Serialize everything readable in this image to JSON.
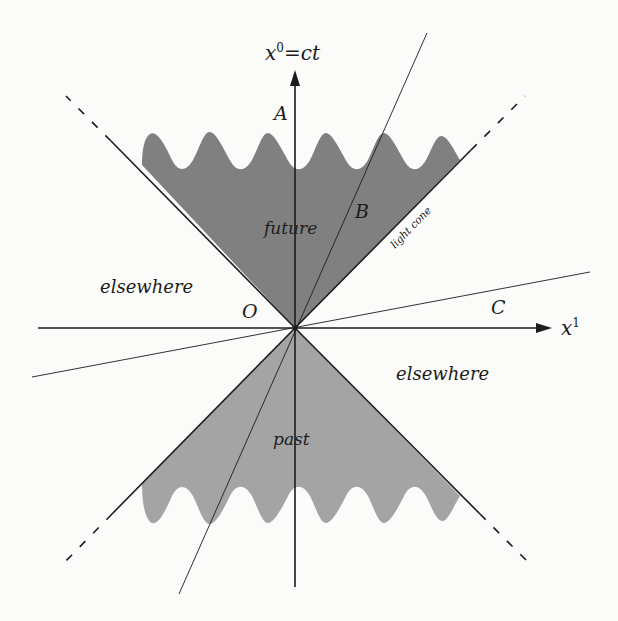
{
  "diagram": {
    "axes": {
      "time_axis_label": "x",
      "time_axis_sup": "0",
      "time_axis_eq": "=ct",
      "space_axis_label": "x",
      "space_axis_sup": "1"
    },
    "points": {
      "origin": "O",
      "a": "A",
      "b": "B",
      "c": "C"
    },
    "regions": {
      "future": "future",
      "past": "past",
      "elsewhere_left": "elsewhere",
      "elsewhere_right": "elsewhere"
    },
    "annotations": {
      "light_cone": "light cone"
    },
    "colors": {
      "background": "#fbfbfa",
      "future_fill": "#808080",
      "past_fill": "#a4a4a4",
      "line": "#1c1c1c"
    }
  }
}
